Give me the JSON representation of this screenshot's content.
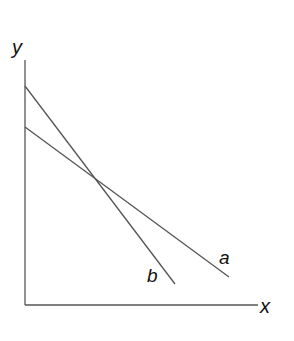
{
  "diagram": {
    "axes": {
      "y_label": "y",
      "x_label": "x",
      "origin": [
        25,
        305
      ],
      "y_top": [
        25,
        60
      ],
      "x_end": [
        258,
        305
      ]
    },
    "lines": [
      {
        "name": "a",
        "label": "a",
        "start": [
          25,
          127
        ],
        "end": [
          229,
          277
        ],
        "label_pos": [
          219,
          264
        ]
      },
      {
        "name": "b",
        "label": "b",
        "start": [
          25,
          86
        ],
        "end": [
          175,
          284
        ],
        "label_pos": [
          147,
          282
        ]
      }
    ],
    "colors": {
      "line": "#555555",
      "axis": "#555555",
      "text": "#111111"
    }
  }
}
